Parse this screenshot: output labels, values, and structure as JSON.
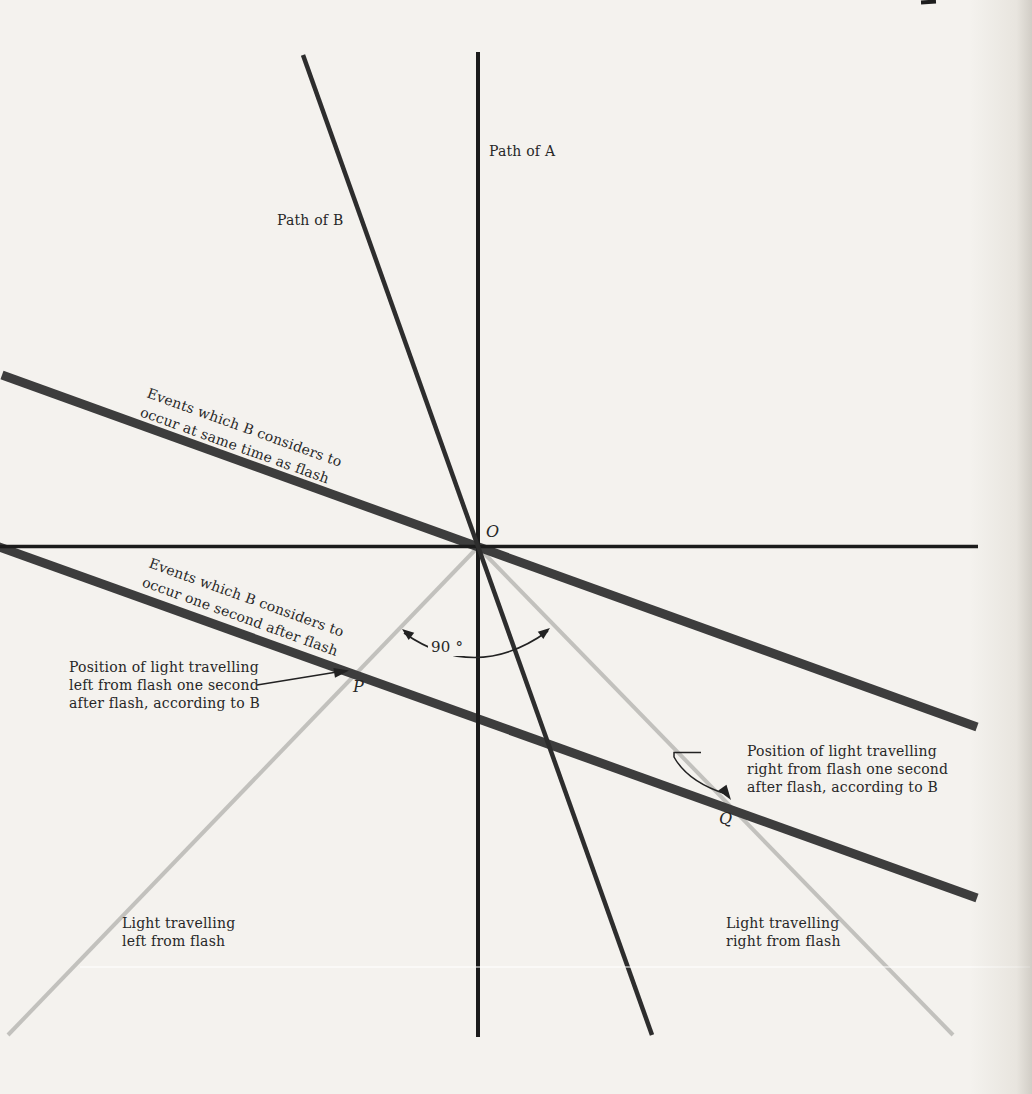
{
  "figure": {
    "background": "#f4f2ee",
    "colors": {
      "axis": "#1b1b1b",
      "worldline_b": "#2d2d2d",
      "simultaneity": "#3d3d3d",
      "light_ray": "#c2c1bd",
      "annotation": "#222222",
      "text": "#272727"
    },
    "axes": {
      "path_a_label": "Path of A",
      "path_b_label": "Path of B",
      "origin_label": "O"
    },
    "simultaneity_lines": {
      "same_time_label": "Events which B considers to\noccur at same time as flash",
      "one_second_label": "Events which B considers to\noccur one second after flash"
    },
    "light_rays": {
      "left_label": "Light travelling\nleft from flash",
      "right_label": "Light travelling\nright from flash"
    },
    "points": {
      "p_label": "P",
      "q_label": "Q"
    },
    "annotations": {
      "angle_label": "90 °",
      "pos_left_label": "Position of light travelling\nleft from flash one second\nafter flash, according to B",
      "pos_right_label": "Position of light travelling\nright from flash one second\nafter flash, according to B"
    }
  }
}
